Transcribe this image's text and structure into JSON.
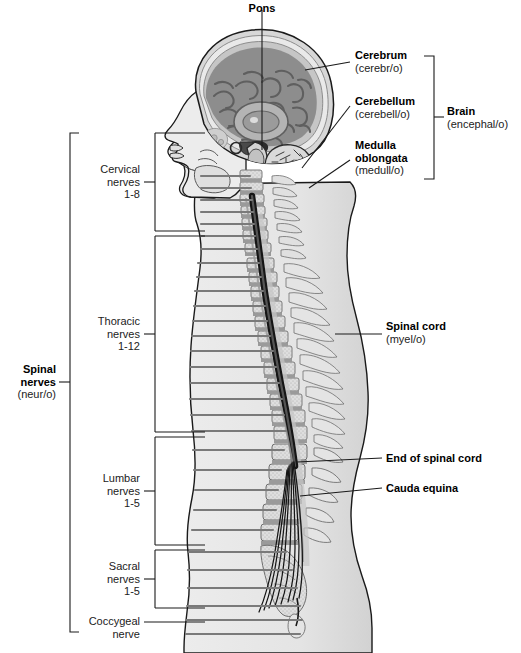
{
  "figure": {
    "palette": {
      "background": "#ffffff",
      "body_fill": "#e3e3e3",
      "body_inner": "#ededed",
      "outline": "#1a1a1a",
      "cerebrum": "#8d8d8d",
      "cerebrum_dark": "#6f6f6f",
      "cerebellum": "#d8d8d8",
      "skull": "#c9c9c9",
      "vertebra": "#dcdcdc",
      "disc": "#9a9a9a",
      "cord": "#151515",
      "nerve_line": "#7a7a7a",
      "leader": "#1a1a1a"
    }
  },
  "labels": {
    "pons": {
      "name": "Pons",
      "root": ""
    },
    "cerebrum": {
      "name": "Cerebrum",
      "root": "(cerebr/o)"
    },
    "cerebellum": {
      "name": "Cerebellum",
      "root": "(cerebell/o)"
    },
    "medulla": {
      "name": "Medulla",
      "name2": "oblongata",
      "root": "(medull/o)"
    },
    "brain_group": {
      "name": "Brain",
      "root": "(encephal/o)"
    },
    "spinal_cord": {
      "name": "Spinal cord",
      "root": "(myel/o)"
    },
    "end_of_cord": {
      "name": "End of spinal cord",
      "root": ""
    },
    "cauda_equina": {
      "name": "Cauda equina",
      "root": ""
    },
    "cervical": {
      "line1": "Cervical",
      "line2": "nerves",
      "line3": "1-8"
    },
    "thoracic": {
      "line1": "Thoracic",
      "line2": "nerves",
      "line3": "1-12"
    },
    "lumbar": {
      "line1": "Lumbar",
      "line2": "nerves",
      "line3": "1-5"
    },
    "sacral": {
      "line1": "Sacral",
      "line2": "nerves",
      "line3": "1-5"
    },
    "coccygeal": {
      "line1": "Coccygeal",
      "line2": "nerve"
    },
    "spinal_nerves_group": {
      "name": "Spinal",
      "name2": "nerves",
      "root": "(neur/o)"
    }
  }
}
